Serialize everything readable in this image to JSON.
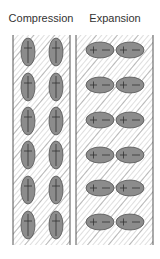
{
  "diagram": {
    "panels": [
      {
        "id": "compression",
        "title": "Compression",
        "orientation": "vertical",
        "x": 13,
        "y": 35,
        "width": 57,
        "height": 210,
        "ellipses": {
          "rx": 7,
          "ry": 14,
          "centers_x": [
            28,
            56
          ],
          "centers_y": [
            52,
            87,
            121,
            155,
            190,
            225
          ],
          "symbol": "+"
        }
      },
      {
        "id": "expansion",
        "title": "Expansion",
        "orientation": "horizontal",
        "x": 76,
        "y": 35,
        "width": 77,
        "height": 210,
        "ellipses": {
          "rx": 14,
          "ry": 8,
          "centers_x": [
            100,
            130
          ],
          "centers_y": [
            50,
            85,
            120,
            155,
            188,
            222
          ],
          "symbol": "+ −"
        }
      }
    ],
    "colors": {
      "ellipse_fill": "#8c8c8c",
      "ellipse_stroke": "#555555",
      "hatch_light": "#c8c8c8",
      "hatch_dark": "#8a8a8a",
      "border": "#555555",
      "text": "#333333"
    }
  }
}
